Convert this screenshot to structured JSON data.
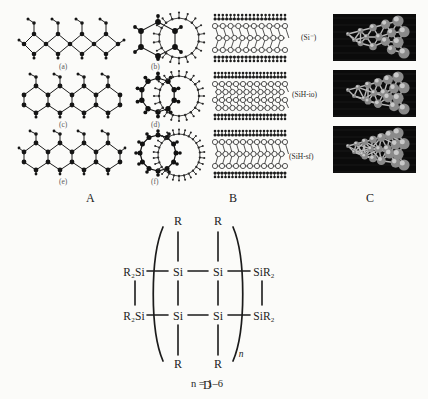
{
  "figure": {
    "background": "#fbfbf9",
    "ink": "#1a1a1a"
  },
  "panels": {
    "a": {
      "letter": "A",
      "caption_color": "#5a5a5a",
      "sublabels": [
        "(a)",
        "(b)",
        "(c)",
        "(d)",
        "(e)",
        "(f)"
      ],
      "description": "Silicon sheet and nanotube cross-section ball-and-stick models",
      "rows": [
        {
          "sheet": "(a)",
          "small_ring": "(b)",
          "rings_small": 6,
          "rings_large": 18
        },
        {
          "sheet": "(c)",
          "small_ring": "(d)",
          "rings_small": 10,
          "rings_large": 20
        },
        {
          "sheet": "(e)",
          "small_ring": "(f)",
          "rings_small": 12,
          "rings_large": 26
        }
      ]
    },
    "b": {
      "letter": "B",
      "description": "Hydrogenated silicon slab lattice models",
      "rows": 3
    },
    "c": {
      "letter": "C",
      "description": "Rendered three-dimensional silicon cluster models",
      "images": [
        {
          "label": "(Si⁻)"
        },
        {
          "label": "(SiH-io)"
        },
        {
          "label": "(SiH-sf)"
        }
      ]
    },
    "d": {
      "letter": "D",
      "description": "Ladder polysilane chemical structure",
      "repeat_note": "n = 1–6",
      "repeat_symbol": "n",
      "end_groups_left": [
        "R₂Si",
        "R₂Si"
      ],
      "end_groups_right": [
        "SiR₂",
        "SiR₂"
      ],
      "backbone_atoms": [
        "Si",
        "Si",
        "Si",
        "Si"
      ],
      "substituents_top": [
        "R",
        "R"
      ],
      "substituents_bottom": [
        "R",
        "R"
      ],
      "left_label_1": "R₂Si",
      "left_label_2": "R₂Si",
      "right_label_1": "SiR₂",
      "right_label_2": "SiR₂",
      "si_1": "Si",
      "si_2": "Si",
      "si_3": "Si",
      "si_4": "Si",
      "r_top_1": "R",
      "r_top_2": "R",
      "r_bot_1": "R",
      "r_bot_2": "R"
    }
  }
}
